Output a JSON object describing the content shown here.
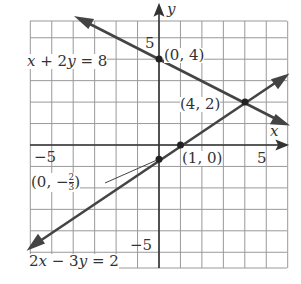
{
  "chart_data": {
    "type": "line",
    "title": "",
    "xlabel": "x",
    "ylabel": "y",
    "xlim": [
      -6,
      6
    ],
    "ylim": [
      -5.7,
      5.8
    ],
    "grid": true,
    "tick_labels": {
      "x": [
        "-5",
        "5"
      ],
      "y": [
        "5",
        "-5"
      ]
    },
    "series": [
      {
        "name": "x + 2y = 8",
        "equation": "y = 4 - x/2",
        "points": [
          [
            -3.5,
            5.75
          ],
          [
            0,
            4
          ],
          [
            4,
            2
          ],
          [
            6,
            1
          ]
        ]
      },
      {
        "name": "2x - 3y = 2",
        "equation": "y = (2x - 2)/3",
        "points": [
          [
            -6,
            -4.67
          ],
          [
            0,
            -0.667
          ],
          [
            1,
            0
          ],
          [
            4,
            2
          ],
          [
            6,
            3.33
          ]
        ]
      }
    ],
    "annotations": [
      {
        "text": "(0, 4)",
        "x": 0,
        "y": 4
      },
      {
        "text": "(4, 2)",
        "x": 4,
        "y": 2
      },
      {
        "text": "(1, 0)",
        "x": 1,
        "y": 0
      },
      {
        "text": "(0, -2/3)",
        "x": 0,
        "y": -0.667
      }
    ]
  },
  "labels": {
    "eq1": {
      "lhs_x": "x",
      "plus": " + 2",
      "y": "y",
      "rhs": " = 8"
    },
    "eq2": {
      "a": "2",
      "x": "x",
      "minus": " − 3",
      "y": "y",
      "rhs": " = 2"
    },
    "p04": "(0, 4)",
    "p42": "(4, 2)",
    "p10": "(1, 0)",
    "p023_pre": "(0, −",
    "p023_num": "2",
    "p023_den": "3",
    "p023_post": ")",
    "xtick_neg5": "−5",
    "xtick_5": "5",
    "ytick_5": "5",
    "ytick_neg5": "−5",
    "axis_x": "x",
    "axis_y": "y"
  }
}
